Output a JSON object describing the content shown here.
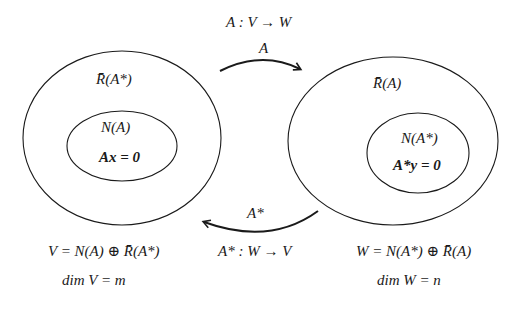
{
  "diagram": {
    "title_map_A": "A : V → W",
    "arrow_A_label": "A",
    "arrow_Astar_label": "A*",
    "title_map_Astar": "A* : W → V",
    "left_space": {
      "outer_label": "R̄(A*)",
      "inner_label": "N(A)",
      "inner_equation": "Ax = 0",
      "decomposition": "V = N(A) ⊕ R̄(A*)",
      "dimension": "dim V = m"
    },
    "right_space": {
      "outer_label": "R̄(A)",
      "inner_label": "N(A*)",
      "inner_equation": "A*y = 0",
      "decomposition": "W = N(A*) ⊕ R̄(A)",
      "dimension": "dim W = n"
    },
    "colors": {
      "stroke": "#1a1a1a",
      "background": "#ffffff"
    }
  }
}
